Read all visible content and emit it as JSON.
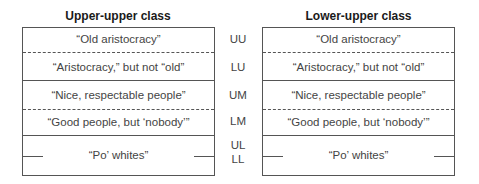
{
  "panels": [
    {
      "title": "Upper-upper class",
      "rows": [
        "“Old aristocracy”",
        "“Aristocracy,” but not “old”",
        "“Nice, respectable people”",
        "“Good people, but ‘nobody’”",
        "“Po’ whites”"
      ]
    },
    {
      "title": "Lower-upper class",
      "rows": [
        "“Old aristocracy”",
        "“Aristocracy,” but not “old”",
        "“Nice, respectable people”",
        "“Good people, but ‘nobody’”",
        "“Po’ whites”"
      ]
    }
  ],
  "class_labels": [
    "UU",
    "LU",
    "UM",
    "LM",
    "UL",
    "LL"
  ],
  "colors": {
    "line": "#555555",
    "text": "#444444",
    "title": "#1a1a1a"
  }
}
